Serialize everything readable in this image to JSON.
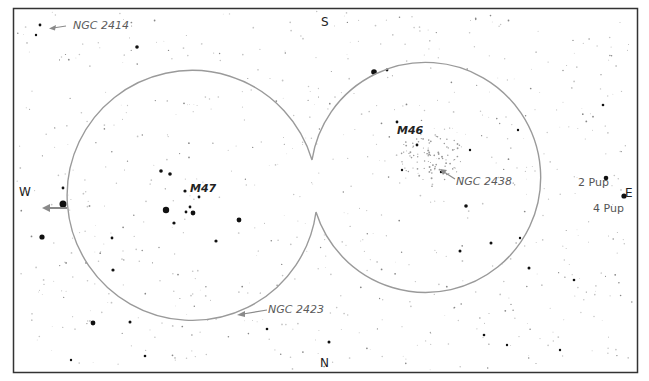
{
  "map": {
    "type": "star-finder-chart",
    "compass": {
      "top": "S",
      "bottom": "N",
      "left": "W",
      "right": "E"
    },
    "fields_of_view": [
      {
        "name": "M47 field",
        "center_label": "M47"
      },
      {
        "name": "M46 field",
        "center_label": "M46"
      }
    ],
    "labels": {
      "ngc2414": "NGC 2414",
      "m47": "M47",
      "m46": "M46",
      "ngc2438": "NGC 2438",
      "ngc2423": "NGC 2423",
      "pup2": "2 Pup",
      "pup4": "4 Pup"
    },
    "colors": {
      "frame": "#333333",
      "circle": "#9a9a9a",
      "arrow": "#8a8a8a",
      "star": "#111111",
      "faint_star": "#bbbbbb"
    }
  }
}
